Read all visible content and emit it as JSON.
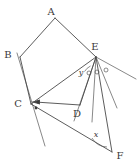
{
  "figure": {
    "stroke_color": "#4a4a4a",
    "label_color": "#3a3a3a",
    "background": "#ffffff",
    "vertices": [
      {
        "id": "A",
        "label": "A",
        "x": 55,
        "y": 18,
        "label_x": 51,
        "label_y": 15
      },
      {
        "id": "B",
        "label": "B",
        "x": 20,
        "y": 57,
        "label_x": 8,
        "label_y": 58
      },
      {
        "id": "C",
        "label": "C",
        "x": 31,
        "y": 104,
        "label_x": 18,
        "label_y": 107
      },
      {
        "id": "D",
        "label": "D",
        "x": 80,
        "y": 105,
        "label_x": 77,
        "label_y": 117
      },
      {
        "id": "E",
        "label": "E",
        "x": 96,
        "y": 57,
        "label_x": 95,
        "label_y": 50
      },
      {
        "id": "F",
        "label": "F",
        "x": 112,
        "y": 152,
        "label_x": 116,
        "label_y": 157
      }
    ],
    "angle_labels": [
      {
        "id": "y",
        "label": "y",
        "x": 81,
        "y": 74,
        "vertex": "E"
      },
      {
        "id": "x",
        "label": "x",
        "x": 96,
        "y": 137,
        "vertex": "F"
      }
    ],
    "angle_marks": {
      "circle_marks_at_E": 3,
      "dot_marks_at_C": 2
    },
    "edges": [
      {
        "from": "A",
        "to": "B"
      },
      {
        "from": "A",
        "to": "E"
      },
      {
        "from": "B",
        "to": "C"
      },
      {
        "from": "C",
        "to": "E"
      },
      {
        "from": "C",
        "to": "D"
      },
      {
        "from": "D",
        "to": "E"
      },
      {
        "from": "C",
        "to": "F"
      },
      {
        "from": "E",
        "to": "F"
      }
    ]
  }
}
